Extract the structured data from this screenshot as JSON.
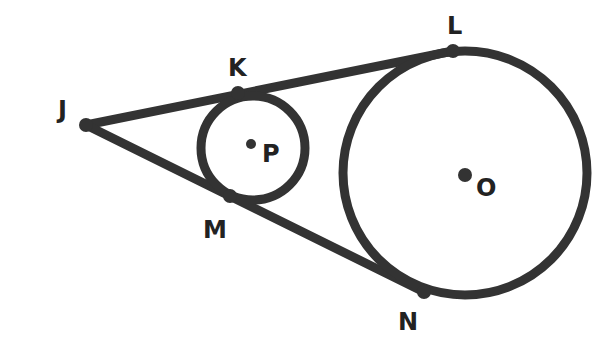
{
  "diagram": {
    "stroke_color": "#333333",
    "points": {
      "J": {
        "label": "J",
        "x": 86,
        "y": 125,
        "lx": 58,
        "ly": 118
      },
      "K": {
        "label": "K",
        "x": 238,
        "y": 93,
        "lx": 228,
        "ly": 76
      },
      "L": {
        "label": "L",
        "x": 453,
        "y": 51,
        "lx": 447,
        "ly": 34
      },
      "M": {
        "label": "M",
        "x": 230,
        "y": 196,
        "lx": 203,
        "ly": 238
      },
      "N": {
        "label": "N",
        "x": 424,
        "y": 292,
        "lx": 398,
        "ly": 330
      },
      "P": {
        "label": "P",
        "x": 251,
        "y": 144,
        "lx": 262,
        "ly": 162
      },
      "O": {
        "label": "O",
        "x": 465,
        "y": 176,
        "lx": 476,
        "ly": 196
      }
    },
    "circles": [
      {
        "name": "circle-P",
        "cx": 253,
        "cy": 148,
        "r": 52
      },
      {
        "name": "circle-O",
        "cx": 465,
        "cy": 173,
        "r": 122
      }
    ],
    "segments": [
      {
        "from": "J",
        "to": "L"
      },
      {
        "from": "J",
        "to": "N"
      }
    ]
  }
}
